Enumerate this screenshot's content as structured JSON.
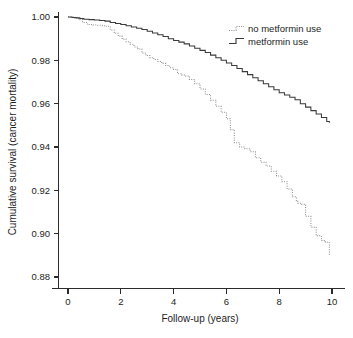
{
  "chart_data": {
    "type": "line",
    "title": "",
    "subtitle": "",
    "xlabel": "Follow-up (years)",
    "ylabel": "Cumulative survival (cancer mortality)",
    "xlim": [
      0,
      10
    ],
    "ylim": [
      0.88,
      1.0
    ],
    "xticks": [
      0,
      2,
      4,
      6,
      8,
      10
    ],
    "xtick_labels": [
      "0",
      "2",
      "4",
      "6",
      "8",
      "10"
    ],
    "yticks": [
      0.88,
      0.9,
      0.92,
      0.94,
      0.96,
      0.98,
      1.0
    ],
    "ytick_labels": [
      "0.88",
      "0.90",
      "0.92",
      "0.94",
      "0.96",
      "0.98",
      "1.00"
    ],
    "grid": false,
    "legend_position": "top-right",
    "plot_style": "kaplan-meier step curves, open L-shaped axes",
    "series": [
      {
        "name": "no metformin use",
        "line_style": "dotted",
        "color": "#8d8d8d",
        "x": [
          0.0,
          0.2,
          0.4,
          0.55,
          0.7,
          0.8,
          0.95,
          1.1,
          1.3,
          1.45,
          1.6,
          1.75,
          1.9,
          2.05,
          2.2,
          2.35,
          2.5,
          2.65,
          2.8,
          2.95,
          3.1,
          3.25,
          3.4,
          3.55,
          3.7,
          3.85,
          4.0,
          4.15,
          4.3,
          4.45,
          4.6,
          4.8,
          5.0,
          5.2,
          5.4,
          5.6,
          5.8,
          6.0,
          6.15,
          6.3,
          6.5,
          6.7,
          6.9,
          7.1,
          7.3,
          7.5,
          7.7,
          7.9,
          8.1,
          8.3,
          8.5,
          8.65,
          8.7,
          8.85,
          9.0,
          9.2,
          9.4,
          9.6,
          9.75,
          9.85,
          9.9
        ],
        "y": [
          1.0,
          0.9995,
          0.9988,
          0.9975,
          0.9968,
          0.9965,
          0.9963,
          0.9962,
          0.996,
          0.9957,
          0.994,
          0.9925,
          0.9912,
          0.9898,
          0.9886,
          0.9874,
          0.9862,
          0.9852,
          0.9834,
          0.9822,
          0.9812,
          0.9804,
          0.9795,
          0.9786,
          0.9776,
          0.9766,
          0.9758,
          0.9738,
          0.9732,
          0.9728,
          0.9712,
          0.9692,
          0.9668,
          0.9642,
          0.9616,
          0.9588,
          0.956,
          0.953,
          0.948,
          0.942,
          0.94,
          0.9392,
          0.9378,
          0.935,
          0.933,
          0.9312,
          0.9288,
          0.9266,
          0.924,
          0.9206,
          0.917,
          0.915,
          0.914,
          0.9136,
          0.908,
          0.903,
          0.899,
          0.8968,
          0.896,
          0.8958,
          0.89
        ]
      },
      {
        "name": "metformin use",
        "line_style": "solid",
        "color": "#3a3a3a",
        "x": [
          0.0,
          0.15,
          0.3,
          0.45,
          0.6,
          0.8,
          1.0,
          1.2,
          1.4,
          1.6,
          1.8,
          2.0,
          2.2,
          2.4,
          2.6,
          2.8,
          3.0,
          3.2,
          3.4,
          3.6,
          3.8,
          4.0,
          4.2,
          4.4,
          4.6,
          4.8,
          5.0,
          5.2,
          5.4,
          5.6,
          5.8,
          6.0,
          6.2,
          6.4,
          6.6,
          6.8,
          7.0,
          7.2,
          7.4,
          7.6,
          7.8,
          8.0,
          8.2,
          8.4,
          8.6,
          8.8,
          9.0,
          9.2,
          9.4,
          9.6,
          9.8,
          9.9
        ],
        "y": [
          1.0,
          0.9998,
          0.9996,
          0.9993,
          0.999,
          0.9988,
          0.9986,
          0.9984,
          0.9981,
          0.9975,
          0.997,
          0.9965,
          0.996,
          0.9954,
          0.9948,
          0.9942,
          0.9934,
          0.9926,
          0.9918,
          0.991,
          0.99,
          0.9892,
          0.9884,
          0.9876,
          0.9866,
          0.9856,
          0.9846,
          0.9836,
          0.9824,
          0.9812,
          0.98,
          0.9788,
          0.9776,
          0.9762,
          0.9748,
          0.9734,
          0.972,
          0.9706,
          0.9692,
          0.9678,
          0.9664,
          0.965,
          0.964,
          0.963,
          0.9618,
          0.96,
          0.9584,
          0.9568,
          0.9552,
          0.9536,
          0.9518,
          0.9512
        ]
      }
    ]
  },
  "legend": {
    "entries": [
      {
        "label": "no metformin use",
        "style": "dotted"
      },
      {
        "label": "metformin use",
        "style": "solid"
      }
    ]
  },
  "axes": {
    "x_title": "Follow-up (years)",
    "y_title": "Cumulative survival (cancer mortality)"
  }
}
